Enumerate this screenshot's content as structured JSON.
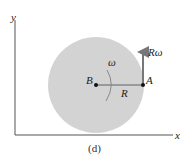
{
  "diagram": {
    "axes": {
      "x_label": "x",
      "y_label": "y"
    },
    "disk": {
      "fill": "#d3d3d3"
    },
    "points": {
      "center_label": "B",
      "edge_label": "A"
    },
    "radius_label": "R",
    "angular_velocity_label": "ω",
    "velocity_label": "Rω",
    "caption": "(d)",
    "colors": {
      "axis": "#555555",
      "arrow": "#777777",
      "line": "#444444",
      "dot": "#111111"
    }
  }
}
